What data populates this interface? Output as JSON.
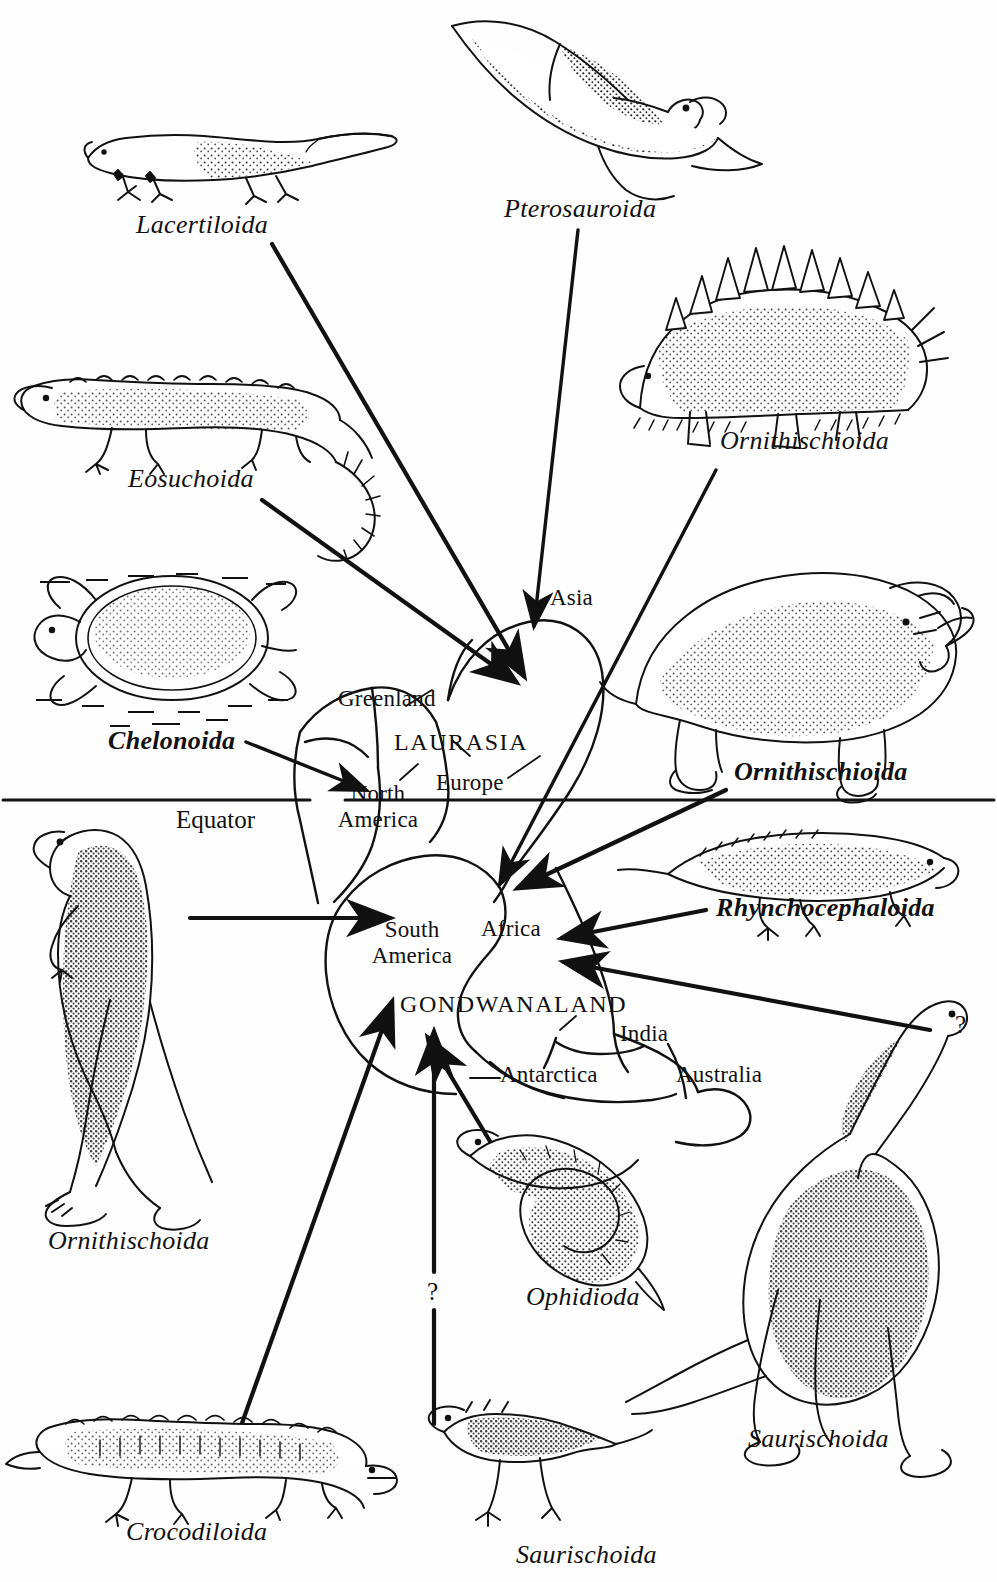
{
  "figure": {
    "type": "paleogeographic-dispersal-diagram",
    "equator_label": "Equator",
    "supercontinents": [
      {
        "name": "LAURASIA",
        "hemisphere": "northern"
      },
      {
        "name": "GONDWANALAND",
        "hemisphere": "southern"
      }
    ]
  },
  "landmasses": [
    {
      "key": "greenland",
      "label": "Greenland",
      "supercontinent": "LAURASIA"
    },
    {
      "key": "north_america",
      "label": "North\nAmerica",
      "line1": "North",
      "line2": "America",
      "supercontinent": "LAURASIA"
    },
    {
      "key": "europe",
      "label": "Europe",
      "supercontinent": "LAURASIA"
    },
    {
      "key": "asia",
      "label": "Asia",
      "supercontinent": "LAURASIA"
    },
    {
      "key": "south_america",
      "label": "South\nAmerica",
      "line1": "South",
      "line2": "America",
      "supercontinent": "GONDWANALAND"
    },
    {
      "key": "africa",
      "label": "Africa",
      "supercontinent": "GONDWANALAND"
    },
    {
      "key": "india",
      "label": "India",
      "supercontinent": "GONDWANALAND"
    },
    {
      "key": "antarctica",
      "label": "Antarctica",
      "supercontinent": "GONDWANALAND"
    },
    {
      "key": "australia",
      "label": "Australia",
      "supercontinent": "GONDWANALAND"
    }
  ],
  "taxa": [
    {
      "key": "lacertiloida",
      "label": "Lacertiloida",
      "emphasis": "italic",
      "position": "top-left",
      "target": "laurasia"
    },
    {
      "key": "pterosauroida",
      "label": "Pterosauroida",
      "emphasis": "italic",
      "position": "top-center",
      "target": "asia"
    },
    {
      "key": "ornithischioida_top",
      "label": "Ornithischioida",
      "emphasis": "italic",
      "position": "top-right",
      "target": "africa"
    },
    {
      "key": "eosuchoida",
      "label": "Eosuchoida",
      "emphasis": "italic",
      "position": "upper-left",
      "target": "laurasia"
    },
    {
      "key": "chelonoida",
      "label": "Chelonoida",
      "emphasis": "bold-italic",
      "position": "mid-left",
      "target": "north-america"
    },
    {
      "key": "ornithischioida_mid",
      "label": "Ornithischioida",
      "emphasis": "bold-italic",
      "position": "mid-right",
      "target": "africa"
    },
    {
      "key": "rhynchocephaloida",
      "label": "Rhynchocephaloida",
      "emphasis": "bold-italic",
      "position": "right",
      "target": "africa"
    },
    {
      "key": "ornithischoida_left",
      "label": "Ornithischoida",
      "emphasis": "italic",
      "position": "lower-left",
      "target": "south-america"
    },
    {
      "key": "ophidioda",
      "label": "Ophidioda",
      "emphasis": "italic",
      "position": "bottom-center",
      "target": "gondwanaland"
    },
    {
      "key": "saurischoida_right",
      "label": "Saurischoida",
      "emphasis": "italic",
      "position": "bottom-right",
      "target": "africa"
    },
    {
      "key": "crocodiloida",
      "label": "Crocodiloida",
      "emphasis": "italic",
      "position": "bottom-left",
      "target": "south-america"
    },
    {
      "key": "saurischoida_bottom",
      "label": "Saurischoida",
      "emphasis": "italic",
      "position": "bottom-center",
      "target": "gondwanaland"
    }
  ],
  "uncertainty_marks": [
    {
      "key": "q_bottom",
      "label": "?",
      "near": "saurischoida-bottom-arrow"
    },
    {
      "key": "q_right",
      "label": "?",
      "near": "saurischoida-right-arrow"
    }
  ],
  "colors": {
    "ink": "#111111",
    "paper": "#ffffff",
    "stipple": "#1a1a1a"
  }
}
